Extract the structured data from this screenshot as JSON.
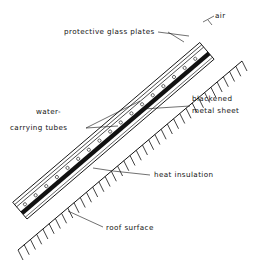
{
  "diagram": {
    "type": "cross-section",
    "labels": {
      "air": "air",
      "glass": "protective glass plates",
      "tubes_line1": "water-",
      "tubes_line2": "carrying tubes",
      "sheet_line1": "blackened",
      "sheet_line2": "metal sheet",
      "insulation": "heat insulation",
      "roof": "roof surface"
    },
    "colors": {
      "ink": "#111111",
      "background": "#ffffff"
    }
  }
}
